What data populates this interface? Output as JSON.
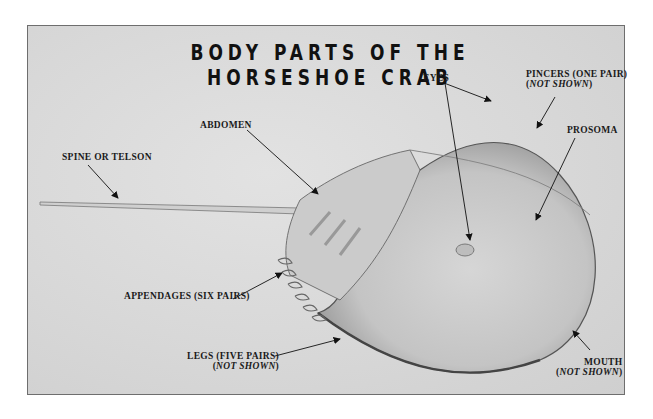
{
  "title": "BODY PARTS OF THE HORSESHOE CRAB",
  "labels": {
    "spine": "SPINE OR TELSON",
    "abdomen": "ABDOMEN",
    "eyes": "EYES",
    "pincers_line1": "PINCERS (ONE PAIR)",
    "pincers_open": "(",
    "pincers_italic": "NOT SHOWN",
    "pincers_close": ")",
    "prosoma": "PROSOMA",
    "appendages": "APPENDAGES (SIX PAIRS)",
    "legs_line1": "LEGS (FIVE PAIRS)",
    "legs_open": "(",
    "legs_italic": "NOT SHOWN",
    "legs_close": ")",
    "mouth_line1": "MOUTH",
    "mouth_open": "(",
    "mouth_italic": "NOT SHOWN",
    "mouth_close": ")"
  }
}
